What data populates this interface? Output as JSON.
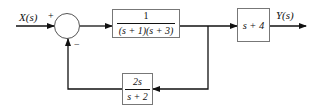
{
  "diagram": {
    "type": "feedback block diagram",
    "input_label": "X(s)",
    "output_label": "Y(s)",
    "summing_junction": {
      "signs": {
        "input": "+",
        "feedback": "−"
      }
    },
    "blocks": {
      "forward": {
        "numerator": "1",
        "denominator": "(s + 1)(s + 3)"
      },
      "output": {
        "expression": "s + 4"
      },
      "feedback": {
        "numerator": "2s",
        "denominator": "s + 2"
      }
    },
    "colors": {
      "line": "#111111",
      "block_border": "#777777",
      "background": "#ffffff"
    }
  }
}
